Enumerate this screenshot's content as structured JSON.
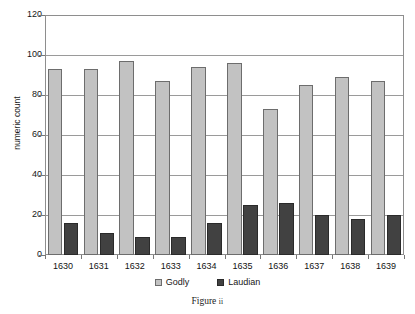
{
  "figure": {
    "caption_label": "Figure",
    "caption_numeral": "ii"
  },
  "chart_data": {
    "type": "bar",
    "title": "",
    "xlabel": "",
    "ylabel": "numeric count",
    "ylim": [
      0,
      120
    ],
    "ytick_step": 20,
    "yticks": [
      "120",
      "100",
      "80",
      "60",
      "40",
      "20",
      "0"
    ],
    "grid": true,
    "legend_position": "bottom-center",
    "categories": [
      "1630",
      "1631",
      "1632",
      "1633",
      "1634",
      "1635",
      "1636",
      "1637",
      "1638",
      "1639"
    ],
    "series": [
      {
        "name": "Godly",
        "color": "#c2c2c2",
        "values": [
          93,
          93,
          97,
          87,
          94,
          96,
          73,
          85,
          89,
          87
        ]
      },
      {
        "name": "Laudian",
        "color": "#414141",
        "values": [
          16,
          11,
          9,
          9,
          16,
          25,
          26,
          20,
          18,
          20
        ]
      }
    ]
  }
}
